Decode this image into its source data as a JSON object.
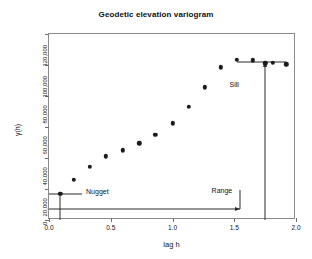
{
  "chart_data": {
    "type": "scatter",
    "title": "Geodetic elevation variogram",
    "xlabel": "lag h",
    "ylabel": "γ(h)",
    "xlim": [
      0.0,
      2.0
    ],
    "ylim": [
      0,
      120000
    ],
    "grid": false,
    "legend": null,
    "xticks": [
      0.0,
      0.5,
      1.0,
      1.5,
      2.0
    ],
    "xtick_labels": [
      "0.0",
      "0.5",
      "1.0",
      "1.5",
      "2.0"
    ],
    "yticks": [
      0,
      20000,
      40000,
      60000,
      80000,
      100000,
      120000
    ],
    "ytick_labels": [
      "0",
      "20,000",
      "40,000",
      "60,000",
      "80,000",
      "100,000",
      "120,000"
    ],
    "series": [
      {
        "name": "semivariance",
        "x": [
          0.09,
          0.2,
          0.33,
          0.46,
          0.6,
          0.73,
          0.86,
          1.0,
          1.13,
          1.26,
          1.39,
          1.52,
          1.65,
          1.75,
          1.81,
          1.92
        ],
        "y": [
          17000,
          26000,
          34500,
          41000,
          45000,
          49500,
          55000,
          62500,
          73000,
          85500,
          98500,
          103500,
          103000,
          101000,
          101500,
          100500
        ]
      }
    ],
    "annotations": [
      {
        "name": "nugget",
        "label": "Nugget",
        "label_x": 0.3,
        "label_y": 18500,
        "value": 17000,
        "marker_x": 0.09
      },
      {
        "name": "range",
        "label": "Range",
        "label_x": 1.4,
        "label_y": 19500,
        "value": 1.55,
        "baseline_y": 7000
      },
      {
        "name": "sill",
        "label": "Sill",
        "label_x": 1.5,
        "label_y": 88000,
        "value": 102000,
        "line_x_start": 1.52,
        "line_x_end": 1.92,
        "marker_x": 1.75
      }
    ]
  }
}
